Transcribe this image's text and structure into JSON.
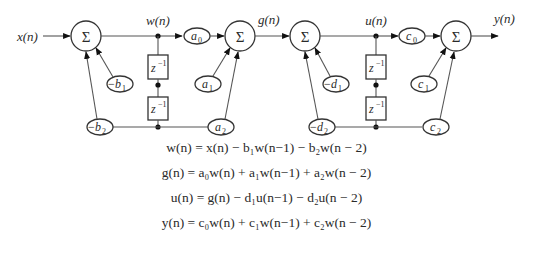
{
  "diagram": {
    "type": "cascaded second-order IIR (direct form II) filter block diagram",
    "signals": {
      "input": "x(n)",
      "w": "w(n)",
      "g": "g(n)",
      "u": "u(n)",
      "output": "y(n)"
    },
    "adders": [
      "Σ",
      "Σ",
      "Σ",
      "Σ"
    ],
    "delays": [
      "z",
      "−1"
    ],
    "section1": {
      "fb1": {
        "sign": "−",
        "var": "b",
        "sub": "1"
      },
      "fb2": {
        "sign": "−",
        "var": "b",
        "sub": "2"
      },
      "ff0": {
        "var": "a",
        "sub": "0"
      },
      "ff1": {
        "var": "a",
        "sub": "1"
      },
      "ff2": {
        "var": "a",
        "sub": "2"
      }
    },
    "section2": {
      "fb1": {
        "sign": "−",
        "var": "d",
        "sub": "1"
      },
      "fb2": {
        "sign": "−",
        "var": "d",
        "sub": "2"
      },
      "ff0": {
        "var": "c",
        "sub": "0"
      },
      "ff1": {
        "var": "c",
        "sub": "1"
      },
      "ff2": {
        "var": "c",
        "sub": "2"
      }
    }
  },
  "equations": [
    "w(n) = x(n) − b₁w(n−1) − b₂w(n − 2)",
    "g(n) = a₀w(n) + a₁w(n−1) + a₂w(n − 2)",
    "u(n) = g(n) − d₁u(n−1) − d₂u(n − 2)",
    "y(n) = c₀w(n) + c₁w(n−1) + c₂w(n − 2)"
  ],
  "colors": {
    "ink": "#2a2a2a",
    "wire": "#555555",
    "background": "#ffffff"
  }
}
